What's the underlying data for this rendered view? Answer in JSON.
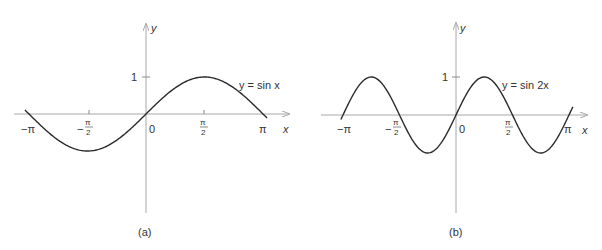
{
  "chart_data": [
    {
      "type": "line",
      "panel_label": "(a)",
      "curve_label": "y = sin x",
      "function": "sin(x)",
      "xlabel": "x",
      "ylabel": "y",
      "x_ticks": [
        "−π",
        "−π/2",
        "0",
        "π/2",
        "π"
      ],
      "y_ticks": [
        "1"
      ],
      "x": [
        -3.1416,
        -2.3562,
        -1.5708,
        -0.7854,
        0,
        0.7854,
        1.5708,
        2.3562,
        3.1416
      ],
      "values": [
        0,
        -0.7071,
        -1,
        -0.7071,
        0,
        0.7071,
        1,
        0.7071,
        0
      ],
      "xlim": [
        -3.25,
        3.25
      ],
      "ylim": [
        -1,
        1
      ],
      "grid": false
    },
    {
      "type": "line",
      "panel_label": "(b)",
      "curve_label": "y = sin 2x",
      "function": "sin(2x)",
      "xlabel": "x",
      "ylabel": "y",
      "x_ticks": [
        "−π",
        "−π/2",
        "0",
        "π/2",
        "π"
      ],
      "y_ticks": [
        "1"
      ],
      "x": [
        -3.1416,
        -2.3562,
        -1.5708,
        -0.7854,
        0,
        0.7854,
        1.5708,
        2.3562,
        3.1416
      ],
      "values": [
        0,
        1,
        0,
        -1,
        0,
        1,
        0,
        -1,
        0
      ],
      "xlim": [
        -3.2,
        3.25
      ],
      "ylim": [
        -1,
        1
      ],
      "grid": false
    }
  ],
  "panels": {
    "a": {
      "label": "(a)",
      "curve_label": "y = sin x",
      "axis_x": "x",
      "axis_y": "y",
      "tick_neg_pi": "−π",
      "tick_neg_half_num": "π",
      "tick_neg_half_den": "2",
      "tick_zero": "0",
      "tick_half_num": "π",
      "tick_half_den": "2",
      "tick_pi": "π",
      "tick_one": "1",
      "minus": "−"
    },
    "b": {
      "label": "(b)",
      "curve_label": "y = sin 2x",
      "axis_x": "x",
      "axis_y": "y",
      "tick_neg_pi": "−π",
      "tick_neg_half_num": "π",
      "tick_neg_half_den": "2",
      "tick_zero": "0",
      "tick_half_num": "π",
      "tick_half_den": "2",
      "tick_pi": "π",
      "tick_one": "1",
      "minus": "−"
    }
  }
}
